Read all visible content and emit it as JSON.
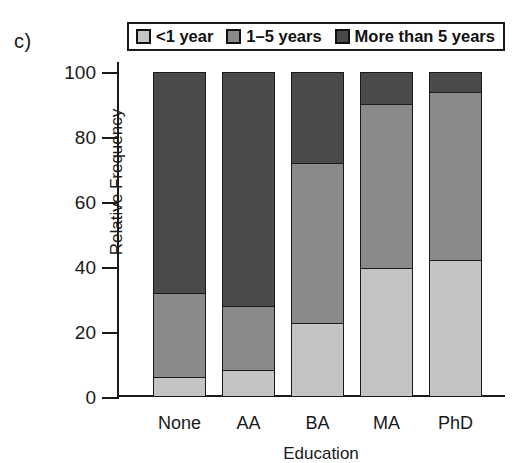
{
  "panel": {
    "label": "c)"
  },
  "legend": {
    "items": [
      {
        "label": "<1 year",
        "color": "#c4c4c4",
        "key": "lt1"
      },
      {
        "label": "1–5 years",
        "color": "#8a8a8a",
        "key": "1to5"
      },
      {
        "label": "More than 5 years",
        "color": "#4a4a4a",
        "key": "gt5"
      }
    ]
  },
  "chart_data": {
    "type": "bar",
    "subtype": "stacked-bar-100",
    "title": "",
    "xlabel": "Education",
    "ylabel": "Relative Frequency",
    "categories": [
      "None",
      "AA",
      "BA",
      "MA",
      "PhD"
    ],
    "ylim": [
      0,
      100
    ],
    "yticks": [
      0,
      20,
      40,
      60,
      80,
      100
    ],
    "ytick_labels": [
      "0",
      "20",
      "40",
      "60",
      "80",
      "100"
    ],
    "grid": false,
    "legend_position": "top",
    "series": [
      {
        "name": "<1 year",
        "color": "#c4c4c4",
        "values": [
          6,
          8,
          22.5,
          39.5,
          42
        ]
      },
      {
        "name": "1–5 years",
        "color": "#8a8a8a",
        "values": [
          26,
          20,
          49.5,
          51,
          52
        ]
      },
      {
        "name": "More than 5 years",
        "color": "#4a4a4a",
        "values": [
          68,
          72,
          28,
          9.5,
          6
        ]
      }
    ],
    "cumulative_tops": {
      "<1 year": [
        6,
        8,
        22.5,
        39.5,
        42
      ],
      "1–5 years": [
        32,
        28,
        72,
        90.5,
        94
      ],
      "More than 5 years": [
        100,
        100,
        100,
        100,
        100
      ]
    }
  }
}
